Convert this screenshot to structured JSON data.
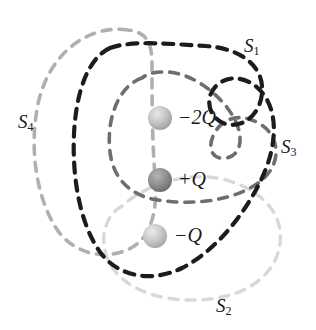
{
  "figure": {
    "background_color": "#ffffff"
  },
  "charges": [
    {
      "id": "charge-minus-2q",
      "label": "−2Q",
      "sign": "negative",
      "magnitude": "2Q",
      "value": -2,
      "sphere_color": "#b8b8b8",
      "x": 160,
      "y": 118,
      "r": 12
    },
    {
      "id": "charge-plus-q",
      "label": "+Q",
      "sign": "positive",
      "magnitude": "Q",
      "value": 1,
      "sphere_color": "#8a8a8a",
      "x": 160,
      "y": 180,
      "r": 12
    },
    {
      "id": "charge-minus-q",
      "label": "−Q",
      "sign": "negative",
      "magnitude": "Q",
      "value": -1,
      "sphere_color": "#bdbdbd",
      "x": 155,
      "y": 236,
      "r": 12
    }
  ],
  "surfaces": [
    {
      "id": "surface-s1",
      "label": "S",
      "subscript": "1",
      "color": "#1c1c1c",
      "line_style": "dashed",
      "label_x": 244,
      "label_y": 36
    },
    {
      "id": "surface-s2",
      "label": "S",
      "subscript": "2",
      "color": "#d8d8d8",
      "line_style": "dashed",
      "label_x": 216,
      "label_y": 296
    },
    {
      "id": "surface-s3",
      "label": "S",
      "subscript": "3",
      "color": "#6e6e6e",
      "line_style": "dashed",
      "label_x": 281,
      "label_y": 137
    },
    {
      "id": "surface-s4",
      "label": "S",
      "subscript": "4",
      "color": "#b0b0b0",
      "line_style": "dashed",
      "label_x": 18,
      "label_y": 112
    }
  ]
}
